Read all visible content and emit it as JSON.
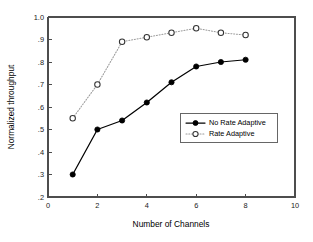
{
  "chart_data": {
    "type": "line",
    "title": "",
    "xlabel": "Number of Channels",
    "ylabel": "Normalized throughput",
    "xlim": [
      0,
      10
    ],
    "ylim": [
      0.2,
      1.0
    ],
    "grid": false,
    "legend_position": "center-right",
    "x_ticks": [
      "0",
      "2",
      "4",
      "6",
      "8",
      "10"
    ],
    "x_tick_values": [
      0,
      2,
      4,
      6,
      8,
      10
    ],
    "y_ticks": [
      "1.0",
      ".9",
      ".8",
      ".7",
      ".6",
      ".5",
      ".4",
      ".3",
      ".2"
    ],
    "y_tick_values": [
      1.0,
      0.9,
      0.8,
      0.7,
      0.6,
      0.5,
      0.4,
      0.3,
      0.2
    ],
    "x": [
      1,
      2,
      3,
      4,
      5,
      6,
      7,
      8
    ],
    "series": [
      {
        "name": "No Rate Adaptive",
        "marker": "filled-circle",
        "line_style": "solid",
        "color": "#000000",
        "values": [
          0.3,
          0.5,
          0.54,
          0.62,
          0.71,
          0.78,
          0.8,
          0.81
        ]
      },
      {
        "name": "Rate Adaptive",
        "marker": "open-circle",
        "line_style": "dotted",
        "color": "#9a9a9a",
        "values": [
          0.55,
          0.7,
          0.89,
          0.91,
          0.93,
          0.95,
          0.93,
          0.92
        ]
      }
    ]
  },
  "legend": {
    "entries": [
      {
        "label": "No Rate Adaptive"
      },
      {
        "label": "Rate Adaptive"
      }
    ]
  }
}
